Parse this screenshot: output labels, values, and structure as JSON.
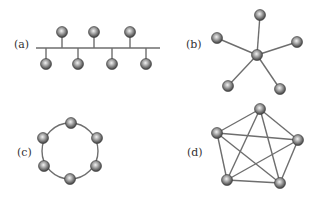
{
  "colors": {
    "edge": "#6e6e6e",
    "node_dark": "#4a4a4a",
    "node_mid": "#8a8a8a",
    "node_light": "#e8e8e8",
    "label": "#333333"
  },
  "node_radius": 5.5,
  "panels": [
    {
      "id": "a",
      "label": "(a)",
      "label_pos": [
        14,
        48
      ],
      "topology": "bus",
      "bus": {
        "x1": 36,
        "x2": 160,
        "y": 48
      },
      "nodes": [
        {
          "x": 62,
          "y": 32,
          "side": "top"
        },
        {
          "x": 94,
          "y": 32,
          "side": "top"
        },
        {
          "x": 130,
          "y": 32,
          "side": "top"
        },
        {
          "x": 46,
          "y": 64,
          "side": "bottom"
        },
        {
          "x": 78,
          "y": 64,
          "side": "bottom"
        },
        {
          "x": 112,
          "y": 64,
          "side": "bottom"
        },
        {
          "x": 146,
          "y": 64,
          "side": "bottom"
        }
      ]
    },
    {
      "id": "b",
      "label": "(b)",
      "label_pos": [
        186,
        48
      ],
      "topology": "star",
      "hub": {
        "x": 257,
        "y": 55
      },
      "nodes": [
        {
          "x": 260,
          "y": 15
        },
        {
          "x": 217,
          "y": 38
        },
        {
          "x": 297,
          "y": 42
        },
        {
          "x": 228,
          "y": 86
        },
        {
          "x": 280,
          "y": 89
        }
      ]
    },
    {
      "id": "c",
      "label": "(c)",
      "label_pos": [
        17,
        156
      ],
      "topology": "ring",
      "center": {
        "x": 70,
        "y": 151
      },
      "ring_radius": 28,
      "nodes": [
        {
          "x": 71,
          "y": 123
        },
        {
          "x": 97,
          "y": 138
        },
        {
          "x": 96,
          "y": 166
        },
        {
          "x": 70,
          "y": 179
        },
        {
          "x": 44,
          "y": 166
        },
        {
          "x": 43,
          "y": 138
        }
      ]
    },
    {
      "id": "d",
      "label": "(d)",
      "label_pos": [
        187,
        156
      ],
      "topology": "fully-connected mesh",
      "nodes": [
        {
          "x": 260,
          "y": 109
        },
        {
          "x": 298,
          "y": 140
        },
        {
          "x": 280,
          "y": 183
        },
        {
          "x": 227,
          "y": 180
        },
        {
          "x": 217,
          "y": 133
        }
      ]
    }
  ]
}
